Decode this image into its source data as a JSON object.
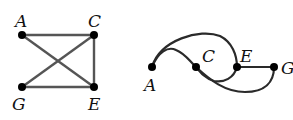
{
  "graph_left": {
    "nodes": [
      {
        "id": "A",
        "label": "A",
        "x": 22,
        "y": 35
      },
      {
        "id": "C",
        "label": "C",
        "x": 94,
        "y": 35
      },
      {
        "id": "G",
        "label": "G",
        "x": 22,
        "y": 87
      },
      {
        "id": "E",
        "label": "E",
        "x": 94,
        "y": 87
      }
    ],
    "edges": [
      [
        "A",
        "C"
      ],
      [
        "A",
        "E"
      ],
      [
        "C",
        "G"
      ],
      [
        "C",
        "E"
      ],
      [
        "G",
        "E"
      ]
    ]
  },
  "graph_right": {
    "nodes": [
      {
        "id": "A",
        "label": "A",
        "x": 152,
        "y": 67
      },
      {
        "id": "C",
        "label": "C",
        "x": 196,
        "y": 67
      },
      {
        "id": "E",
        "label": "E",
        "x": 237,
        "y": 67
      },
      {
        "id": "G",
        "label": "G",
        "x": 274,
        "y": 67
      }
    ],
    "edges": [
      [
        "A",
        "C"
      ],
      [
        "A",
        "E"
      ],
      [
        "C",
        "G"
      ],
      [
        "C",
        "E"
      ],
      [
        "E",
        "G"
      ]
    ]
  },
  "colors": {
    "edge": "#2a2a2a",
    "node": "#000000"
  }
}
